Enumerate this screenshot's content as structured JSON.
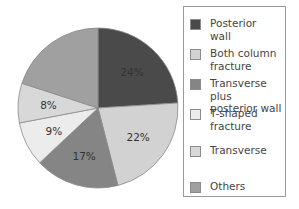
{
  "chart_data": {
    "type": "pie",
    "title": "",
    "start_angle": "12 o'clock",
    "direction": "clockwise",
    "legend_position": "right",
    "slices": [
      {
        "label": "Posterior\nwall",
        "value": 24,
        "display": "24%",
        "color": "#4a4a4a"
      },
      {
        "label": "Both column\nfracture",
        "value": 22,
        "display": "22%",
        "color": "#d2d2d2"
      },
      {
        "label": "Transverse plus\nposterior wall",
        "value": 17,
        "display": "17%",
        "color": "#858585"
      },
      {
        "label": "T-shaped\nfracture",
        "value": 9,
        "display": "9%",
        "color": "#ececec"
      },
      {
        "label": "Transverse",
        "value": 8,
        "display": "8%",
        "color": "#d8d8d8"
      },
      {
        "label": "Others",
        "value": 20,
        "display": "",
        "color": "#a0a0a0"
      }
    ]
  }
}
